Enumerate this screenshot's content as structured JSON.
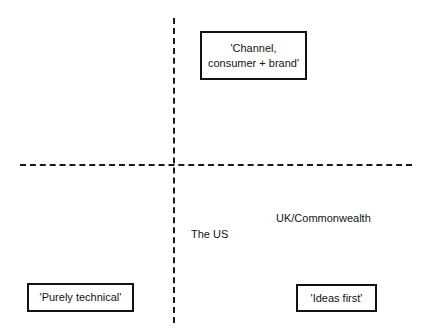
{
  "diagram": {
    "type": "two-by-two-quadrant-matrix",
    "background_color": "#ffffff",
    "line_color": "#1a1a1a",
    "text_color": "#141414",
    "axes": {
      "horizontal": {
        "style": "dashed",
        "name": "horizontal-axis"
      },
      "vertical": {
        "style": "dashed",
        "name": "vertical-axis"
      }
    },
    "boxed_labels": [
      {
        "id": "channel",
        "text": "'Channel,\nconsumer + brand'",
        "quadrant": "top-right"
      },
      {
        "id": "purely-technical",
        "text": "'Purely technical'",
        "quadrant": "bottom-left"
      },
      {
        "id": "ideas-first",
        "text": "'Ideas first'",
        "quadrant": "bottom-right"
      }
    ],
    "plain_labels": [
      {
        "id": "the-us",
        "text": "The US",
        "quadrant": "bottom-right"
      },
      {
        "id": "uk-commonwealth",
        "text": "UK/Commonwealth",
        "quadrant": "bottom-right"
      }
    ]
  }
}
